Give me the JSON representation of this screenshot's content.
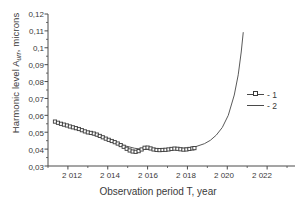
{
  "chart_data": {
    "type": "line",
    "title": "",
    "xlabel": "Observation period T, year",
    "ylabel": "Harmonic level A",
    "ylabel_sub": "urr",
    "ylabel_unit": ", microns",
    "xlim": [
      2011.0,
      2023.4
    ],
    "ylim": [
      0.03,
      0.12
    ],
    "grid": false,
    "legend_position": "right",
    "xticks": [
      "2 012",
      "2 014",
      "2 016",
      "2 018",
      "2 020",
      "2 022"
    ],
    "xtick_values": [
      2012,
      2014,
      2016,
      2018,
      2020,
      2022
    ],
    "yticks": [
      "0,03",
      "0,04",
      "0,05",
      "0,06",
      "0,07",
      "0,08",
      "0,09",
      "0,1",
      "0,11",
      "0,12"
    ],
    "ytick_values": [
      0.03,
      0.04,
      0.05,
      0.06,
      0.07,
      0.08,
      0.09,
      0.1,
      0.11,
      0.12
    ],
    "series": [
      {
        "name": "- 1",
        "style": "markers-line",
        "marker": "square",
        "x": [
          2011.35,
          2011.5,
          2011.65,
          2011.8,
          2011.95,
          2012.1,
          2012.25,
          2012.4,
          2012.55,
          2012.7,
          2012.85,
          2013.0,
          2013.15,
          2013.3,
          2013.45,
          2013.6,
          2013.75,
          2013.9,
          2014.05,
          2014.2,
          2014.35,
          2014.5,
          2014.65,
          2014.8,
          2014.95,
          2015.1,
          2015.25,
          2015.4,
          2015.55,
          2015.7,
          2015.85,
          2016.0,
          2016.15,
          2016.3,
          2016.45,
          2016.6,
          2016.75,
          2016.9,
          2017.05,
          2017.2,
          2017.35,
          2017.5,
          2017.65,
          2017.8,
          2017.95,
          2018.1,
          2018.25,
          2018.35
        ],
        "y": [
          0.0563,
          0.0556,
          0.055,
          0.0545,
          0.054,
          0.0534,
          0.0529,
          0.0524,
          0.0519,
          0.0512,
          0.0505,
          0.0499,
          0.0496,
          0.0492,
          0.0486,
          0.0478,
          0.047,
          0.0462,
          0.0455,
          0.0448,
          0.0441,
          0.0433,
          0.0424,
          0.0414,
          0.0402,
          0.0392,
          0.0386,
          0.0384,
          0.0388,
          0.0398,
          0.0408,
          0.0409,
          0.0404,
          0.0398,
          0.0395,
          0.0394,
          0.0395,
          0.0396,
          0.0398,
          0.0401,
          0.0403,
          0.0402,
          0.0399,
          0.0397,
          0.0398,
          0.0401,
          0.0404,
          0.0406
        ]
      },
      {
        "name": "- 2",
        "style": "line",
        "x": [
          2011.35,
          2011.85,
          2012.35,
          2012.85,
          2013.35,
          2013.85,
          2014.35,
          2014.85,
          2015.35,
          2015.85,
          2016.35,
          2016.85,
          2017.35,
          2017.85,
          2018.35,
          2018.85,
          2019.15,
          2019.45,
          2019.75,
          2020.05,
          2020.35,
          2020.55,
          2020.7,
          2020.8
        ],
        "y": [
          0.0566,
          0.0542,
          0.0521,
          0.0502,
          0.0482,
          0.0461,
          0.044,
          0.042,
          0.0405,
          0.0398,
          0.0397,
          0.0399,
          0.0402,
          0.0405,
          0.0412,
          0.0432,
          0.0452,
          0.0483,
          0.0528,
          0.06,
          0.072,
          0.084,
          0.0975,
          0.109
        ]
      }
    ]
  },
  "legend": {
    "items": [
      {
        "label": "- 1"
      },
      {
        "label": "- 2"
      }
    ]
  },
  "colors": {
    "axis": "#4a4a4a",
    "series1": "#3a3a3a",
    "series2": "#5a5a5a",
    "text": "#3a3a3a",
    "background": "#ffffff"
  }
}
